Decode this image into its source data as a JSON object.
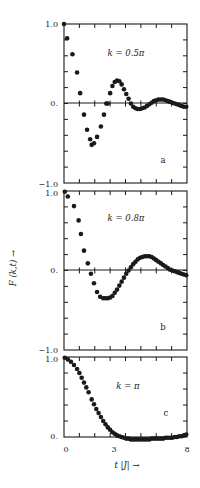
{
  "figure": {
    "ylabel": "F (k,t) →",
    "xlabel": "t |J| →",
    "x_tick_labels": [
      "0",
      "3",
      "8"
    ],
    "ink_color": "#1a1a1a",
    "background": "#ffffff"
  },
  "chart_data": [
    {
      "type": "scatter",
      "panel": "a",
      "title": "k = 0.5π",
      "xlabel": "t |J|",
      "ylabel": "F (k,t)",
      "xlim": [
        0,
        8
      ],
      "ylim": [
        -1.0,
        1.0
      ],
      "y_tick_labels": [
        "1.0",
        "0.",
        "−1.0"
      ],
      "grid": false,
      "zero_line": true,
      "x": [
        0.0,
        0.2,
        0.55,
        0.85,
        1.05,
        1.3,
        1.5,
        1.7,
        1.8,
        1.95,
        2.15,
        2.4,
        2.6,
        2.75,
        2.85,
        3.0,
        3.15,
        3.3,
        3.45,
        3.6,
        3.75,
        3.9,
        4.05,
        4.2,
        4.35,
        4.5,
        4.65,
        4.8,
        4.95,
        5.1,
        5.25,
        5.4,
        5.55,
        5.7,
        5.85,
        6.0,
        6.15,
        6.3,
        6.45,
        6.6,
        6.75,
        6.9,
        7.05,
        7.2,
        7.35,
        7.5,
        7.65,
        7.8,
        7.95
      ],
      "y": [
        1.0,
        0.82,
        0.62,
        0.39,
        0.13,
        -0.14,
        -0.33,
        -0.45,
        -0.52,
        -0.5,
        -0.42,
        -0.29,
        -0.14,
        0.0,
        0.0,
        0.13,
        0.22,
        0.27,
        0.29,
        0.28,
        0.24,
        0.18,
        0.12,
        0.06,
        0.0,
        -0.04,
        -0.06,
        -0.07,
        -0.07,
        -0.06,
        -0.05,
        -0.03,
        -0.01,
        0.01,
        0.03,
        0.04,
        0.05,
        0.05,
        0.05,
        0.04,
        0.03,
        0.02,
        0.01,
        0.0,
        -0.01,
        -0.02,
        -0.03,
        -0.04,
        -0.04
      ]
    },
    {
      "type": "scatter",
      "panel": "b",
      "title": "k = 0.8π",
      "xlabel": "t |J|",
      "ylabel": "F (k,t)",
      "xlim": [
        0,
        8
      ],
      "ylim": [
        -1.0,
        1.0
      ],
      "y_tick_labels": [
        "1.0",
        "0.",
        "−1.0"
      ],
      "grid": false,
      "zero_line": true,
      "x": [
        0.05,
        0.25,
        0.65,
        0.95,
        1.1,
        1.3,
        1.55,
        1.75,
        1.95,
        2.15,
        2.35,
        2.55,
        2.7,
        2.85,
        3.0,
        3.15,
        3.3,
        3.45,
        3.6,
        3.75,
        3.9,
        4.05,
        4.2,
        4.35,
        4.5,
        4.65,
        4.8,
        4.95,
        5.1,
        5.25,
        5.4,
        5.55,
        5.7,
        5.85,
        6.0,
        6.15,
        6.3,
        6.45,
        6.6,
        6.75,
        6.9,
        7.05,
        7.2,
        7.35,
        7.5,
        7.65,
        7.8,
        7.95
      ],
      "y": [
        0.99,
        0.93,
        0.81,
        0.63,
        0.46,
        0.25,
        0.09,
        -0.04,
        -0.16,
        -0.27,
        -0.33,
        -0.35,
        -0.35,
        -0.35,
        -0.34,
        -0.32,
        -0.28,
        -0.24,
        -0.19,
        -0.14,
        -0.09,
        -0.04,
        0.0,
        0.04,
        0.08,
        0.11,
        0.14,
        0.16,
        0.17,
        0.18,
        0.18,
        0.18,
        0.17,
        0.15,
        0.13,
        0.11,
        0.09,
        0.07,
        0.05,
        0.03,
        0.01,
        0.0,
        -0.01,
        -0.02,
        -0.03,
        -0.04,
        -0.05,
        -0.06
      ]
    },
    {
      "type": "scatter",
      "panel": "c",
      "title": "k = π",
      "xlabel": "t |J|",
      "ylabel": "F (k,t)",
      "xlim": [
        0,
        8
      ],
      "ylim": [
        0.0,
        1.0
      ],
      "y_tick_labels": [
        "1.0",
        "0."
      ],
      "grid": false,
      "zero_line": false,
      "x": [
        0.05,
        0.25,
        0.45,
        0.65,
        0.85,
        1.0,
        1.15,
        1.3,
        1.45,
        1.6,
        1.8,
        1.95,
        2.1,
        2.25,
        2.4,
        2.55,
        2.7,
        2.85,
        3.0,
        3.15,
        3.3,
        3.45,
        3.6,
        3.75,
        3.9,
        4.05,
        4.2,
        4.35,
        4.5,
        4.65,
        4.8,
        4.95,
        5.1,
        5.25,
        5.4,
        5.55,
        5.7,
        5.85,
        6.0,
        6.15,
        6.3,
        6.45,
        6.6,
        6.75,
        6.9,
        7.05,
        7.2,
        7.35,
        7.5,
        7.65,
        7.8,
        7.95
      ],
      "y": [
        0.99,
        0.97,
        0.94,
        0.9,
        0.85,
        0.8,
        0.74,
        0.68,
        0.62,
        0.56,
        0.47,
        0.41,
        0.35,
        0.3,
        0.25,
        0.2,
        0.16,
        0.12,
        0.09,
        0.06,
        0.04,
        0.02,
        0.01,
        0.0,
        -0.01,
        -0.02,
        -0.02,
        -0.03,
        -0.03,
        -0.03,
        -0.03,
        -0.03,
        -0.03,
        -0.03,
        -0.03,
        -0.03,
        -0.02,
        -0.02,
        -0.02,
        -0.02,
        -0.02,
        -0.02,
        -0.01,
        -0.01,
        -0.01,
        -0.01,
        0.0,
        0.0,
        0.01,
        0.01,
        0.02,
        0.03
      ]
    }
  ]
}
